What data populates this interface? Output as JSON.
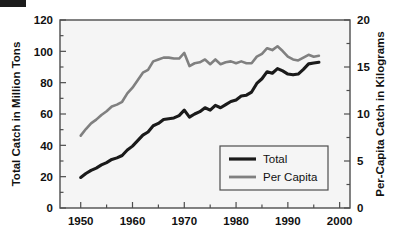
{
  "figure": {
    "background_color": "#ffffff",
    "plot_background_color": "#f5f5f5",
    "frame_color": "#4d4d4d",
    "corner_mark": "black-rectangle-artifact"
  },
  "chart_data": {
    "type": "line",
    "title": "",
    "subtitle": "",
    "xlabel": "",
    "ylabel": "Total Catch in Million Tons",
    "y2label": "Per-Capita Catch in Kilograms",
    "xlim": [
      1946,
      2002
    ],
    "ylim": [
      0,
      120
    ],
    "y2lim": [
      0,
      20
    ],
    "grid": false,
    "legend_position": "lower right",
    "x_ticks": [
      1950,
      1960,
      1970,
      1980,
      1990,
      2000
    ],
    "x_tick_labels": [
      "1950",
      "1960",
      "1970",
      "1980",
      "1990",
      "2000"
    ],
    "x_minor_ticks": [
      1955,
      1965,
      1975,
      1985,
      1995
    ],
    "y_ticks": [
      0,
      20,
      40,
      60,
      80,
      100,
      120
    ],
    "y_tick_labels": [
      "0",
      "20",
      "40",
      "60",
      "80",
      "100",
      "120"
    ],
    "y_minor_ticks": [
      10,
      30,
      50,
      70,
      90,
      110
    ],
    "y2_ticks": [
      0,
      5,
      10,
      15,
      20
    ],
    "y2_tick_labels": [
      "0",
      "5",
      "10",
      "15",
      "20"
    ],
    "y2_minor_ticks": [
      2.5,
      7.5,
      12.5,
      17.5
    ],
    "x": [
      1950,
      1951,
      1952,
      1953,
      1954,
      1955,
      1956,
      1957,
      1958,
      1959,
      1960,
      1961,
      1962,
      1963,
      1964,
      1965,
      1966,
      1967,
      1968,
      1969,
      1970,
      1971,
      1972,
      1973,
      1974,
      1975,
      1976,
      1977,
      1978,
      1979,
      1980,
      1981,
      1982,
      1983,
      1984,
      1985,
      1986,
      1987,
      1988,
      1989,
      1990,
      1991,
      1992,
      1993,
      1994,
      1995,
      1996
    ],
    "series": [
      {
        "name": "Total",
        "axis": "left",
        "color": "#1a1a1a",
        "units": "million tons",
        "values": [
          19.5,
          22.0,
          24.0,
          25.5,
          27.5,
          29.0,
          31.0,
          32.0,
          33.5,
          37.0,
          39.5,
          43.0,
          46.5,
          48.5,
          52.5,
          54.0,
          56.5,
          57.0,
          57.5,
          59.0,
          62.5,
          58.0,
          60.0,
          61.5,
          64.0,
          62.5,
          65.5,
          64.0,
          66.0,
          68.0,
          69.0,
          71.5,
          72.0,
          74.0,
          79.5,
          82.5,
          87.0,
          86.0,
          89.0,
          87.5,
          85.5,
          85.0,
          85.5,
          88.5,
          92.0,
          92.5,
          93.0
        ]
      },
      {
        "name": "Per Capita",
        "axis": "right",
        "color": "#808080",
        "units": "kilograms",
        "values": [
          7.7,
          8.4,
          9.0,
          9.4,
          9.9,
          10.3,
          10.8,
          11.0,
          11.3,
          12.2,
          12.8,
          13.6,
          14.4,
          14.7,
          15.6,
          15.8,
          16.0,
          16.0,
          15.9,
          15.9,
          16.5,
          15.1,
          15.4,
          15.5,
          15.8,
          15.3,
          15.8,
          15.3,
          15.5,
          15.6,
          15.4,
          15.6,
          15.4,
          15.4,
          16.1,
          16.4,
          17.0,
          16.8,
          17.2,
          16.7,
          16.1,
          15.8,
          15.7,
          16.0,
          16.3,
          16.1,
          16.2
        ]
      }
    ],
    "annotations": []
  },
  "legend": {
    "items": [
      {
        "label": "Total",
        "color": "#1a1a1a"
      },
      {
        "label": "Per Capita",
        "color": "#808080"
      }
    ]
  }
}
